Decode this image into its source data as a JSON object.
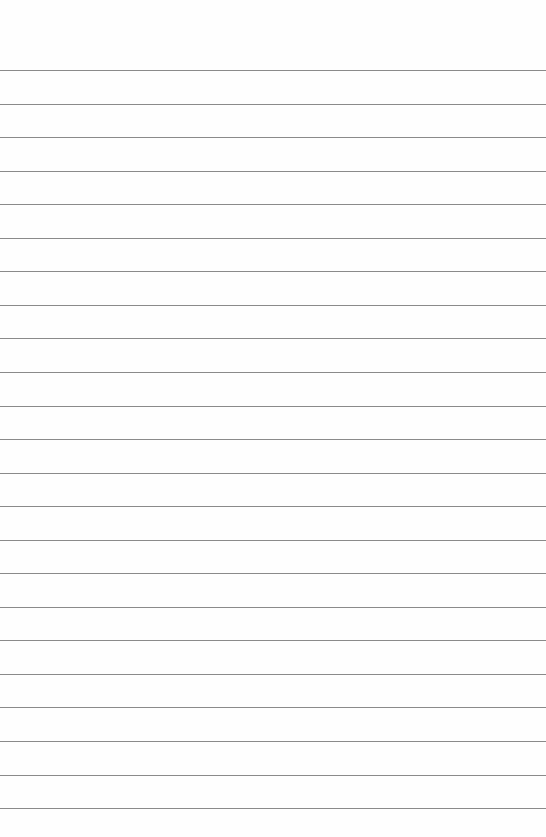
{
  "page": {
    "type": "lined-paper",
    "line_count": 23,
    "first_line_y": 70,
    "line_spacing": 33.55,
    "line_color": "#8a8a8a",
    "background": "#fefefe"
  }
}
